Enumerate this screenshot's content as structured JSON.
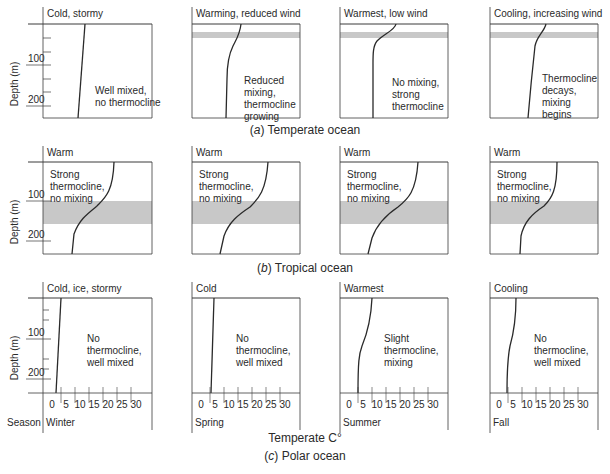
{
  "rows": [
    {
      "caption_letter": "a",
      "caption_text": "Temperate ocean",
      "panels": [
        {
          "condition": "Cold, stormy",
          "note": [
            "Well mixed,",
            "no thermocline"
          ],
          "band": false
        },
        {
          "condition": "Warming, reduced wind",
          "note": [
            "Reduced",
            "mixing,",
            "thermocline",
            "growing"
          ],
          "band": true
        },
        {
          "condition": "Warmest, low wind",
          "note": [
            "No mixing,",
            "strong",
            "thermocline"
          ],
          "band": true
        },
        {
          "condition": "Cooling, increasing wind",
          "note": [
            "Thermocline",
            "decays,",
            "mixing",
            "begins"
          ],
          "band": true
        }
      ]
    },
    {
      "caption_letter": "b",
      "caption_text": "Tropical ocean",
      "panels": [
        {
          "condition": "Warm",
          "note": [
            "Strong",
            "thermocline,",
            "no mixing"
          ],
          "band": true
        },
        {
          "condition": "Warm",
          "note": [
            "Strong",
            "thermocline,",
            "no mixing"
          ],
          "band": true
        },
        {
          "condition": "Warm",
          "note": [
            "Strong",
            "thermocline,",
            "no mixing"
          ],
          "band": true
        },
        {
          "condition": "Warm",
          "note": [
            "Strong",
            "thermocline,",
            "no mixing"
          ],
          "band": true
        }
      ]
    },
    {
      "caption_letter": "c",
      "caption_text": "Polar ocean",
      "panels": [
        {
          "condition": "Cold, ice, stormy",
          "note": [
            "No",
            "thermocline,",
            "well mixed"
          ],
          "band": false,
          "season": "Winter"
        },
        {
          "condition": "Cold",
          "note": [
            "No",
            "thermocline,",
            "well mixed"
          ],
          "band": false,
          "season": "Spring"
        },
        {
          "condition": "Warmest",
          "note": [
            "Slight",
            "thermocline,",
            "mixing"
          ],
          "band": false,
          "season": "Summer"
        },
        {
          "condition": "Cooling",
          "note": [
            "No",
            "thermocline,",
            "well mixed"
          ],
          "band": false,
          "season": "Fall"
        }
      ]
    }
  ],
  "axes": {
    "depth_label": "Depth (m)",
    "depth_ticks": [
      "100",
      "200"
    ],
    "temp_ticks": [
      "0",
      "5",
      "10",
      "15",
      "20",
      "25",
      "30"
    ],
    "temp_label": "Temperate C°",
    "season_label": "Season"
  },
  "colors": {
    "line": "#2a2a2a",
    "band": "#c8c8c8",
    "frame": "#3a3a3a"
  }
}
